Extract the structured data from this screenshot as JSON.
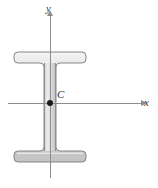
{
  "figure": {
    "background_color": "#ffffff"
  },
  "labels": {
    "y_axis": "y",
    "x_axis": "x",
    "centroid": "C"
  },
  "colors": {
    "axis": "#8c8c8c",
    "outline": "#6e6e6e",
    "fill_light": "#e8e8e8",
    "fill_mid": "#d2d2d2",
    "fill_dark": "#bdbdbd",
    "centroid_dot": "#1a1a1a",
    "label_text": "#3a3a3a"
  },
  "geometry": {
    "x_axis": {
      "x1": 8,
      "y1": 103,
      "x2": 144,
      "y2": 103
    },
    "y_axis": {
      "x1": 50,
      "y1": 14,
      "x2": 50,
      "y2": 178
    },
    "centroid": {
      "x": 50,
      "y": 103
    },
    "top_flange": {
      "left": 14,
      "right": 86,
      "top": 52,
      "bottom": 63
    },
    "bottom_flange": {
      "left": 14,
      "right": 86,
      "top": 151,
      "bottom": 162
    },
    "web": {
      "left": 44,
      "right": 56,
      "top": 63,
      "bottom": 151
    }
  },
  "icons": {
    "x_arrow": "arrow-right-icon",
    "y_arrow": "arrow-up-icon",
    "centroid_marker": "dot-marker-icon"
  }
}
